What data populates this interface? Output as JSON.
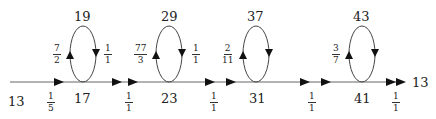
{
  "diagram": {
    "type": "state-transition-chain",
    "main_line_y": 82,
    "start": {
      "label": "13",
      "x": 8,
      "y": 94
    },
    "end": {
      "label": "13",
      "x": 412,
      "y": 76
    },
    "nodes": [
      {
        "label": "17",
        "x": 82,
        "y": 94
      },
      {
        "label": "23",
        "x": 168,
        "y": 94
      },
      {
        "label": "31",
        "x": 257,
        "y": 94
      },
      {
        "label": "41",
        "x": 361,
        "y": 94
      }
    ],
    "loops": [
      {
        "top_label": "19",
        "cx": 83,
        "left_frac": {
          "num": "7",
          "den": "2"
        },
        "right_frac": {
          "num": "1",
          "den": "1"
        }
      },
      {
        "top_label": "29",
        "cx": 170,
        "left_frac": {
          "num": "77",
          "den": "3"
        },
        "right_frac": {
          "num": "1",
          "den": "1"
        }
      },
      {
        "top_label": "37",
        "cx": 256,
        "left_frac": {
          "num": "2",
          "den": "11"
        },
        "right_frac": null
      },
      {
        "top_label": "43",
        "cx": 362,
        "left_frac": {
          "num": "3",
          "den": "7"
        },
        "right_frac": null
      }
    ],
    "edge_fracs": [
      {
        "num": "1",
        "den": "5",
        "x": 51
      },
      {
        "num": "1",
        "den": "1",
        "x": 129
      },
      {
        "num": "1",
        "den": "1",
        "x": 214
      },
      {
        "num": "1",
        "den": "1",
        "x": 312
      },
      {
        "num": "1",
        "den": "1",
        "x": 396
      }
    ]
  }
}
